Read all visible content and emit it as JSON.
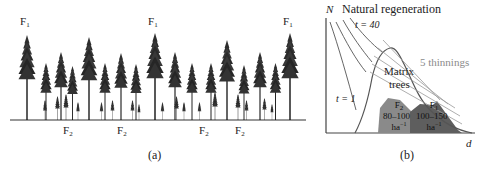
{
  "panel_a": {
    "caption": "(a)",
    "top_labels": [
      {
        "base": "F",
        "sub": "1",
        "x": 24
      },
      {
        "base": "F",
        "sub": "1",
        "x": 152
      },
      {
        "base": "F",
        "sub": "1",
        "x": 286
      }
    ],
    "bottom_labels": [
      {
        "base": "F",
        "sub": "2",
        "x": 63
      },
      {
        "base": "F",
        "sub": "2",
        "x": 117
      },
      {
        "base": "F",
        "sub": "2",
        "x": 199
      },
      {
        "base": "F",
        "sub": "2",
        "x": 235
      }
    ]
  },
  "panel_b": {
    "caption": "(b)",
    "y_axis_label": "N",
    "x_axis_label": "d",
    "title": "Natural regeneration",
    "t_top": "t = 40",
    "t_bottom": "t = 1",
    "thinnings_label": "5 thinnings",
    "matrix_label_1": "Matrix",
    "matrix_label_2": "trees",
    "f2_region": {
      "name": "F",
      "sub": "2",
      "range": "80–100",
      "unit": "ha",
      "exp": "−1",
      "color": "#8a8a8a"
    },
    "f1_region": {
      "name": "F",
      "sub": "1",
      "range": "100–150",
      "unit": "ha",
      "exp": "−1",
      "color": "#5e5e5e"
    },
    "thinnings_color": "#909090"
  }
}
